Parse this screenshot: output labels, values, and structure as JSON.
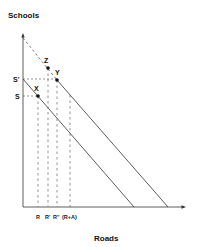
{
  "diagram": {
    "y_axis_label": "Schools",
    "x_axis_label": "Roads",
    "y_ticks": [
      {
        "label": "S'",
        "y": 79
      },
      {
        "label": "S",
        "y": 96
      }
    ],
    "x_ticks": [
      {
        "label": "R",
        "x": 38
      },
      {
        "label": "R'",
        "x": 48
      },
      {
        "label": "R''",
        "x": 57
      },
      {
        "label": "(R+A)",
        "x": 70
      }
    ],
    "points": [
      {
        "label": "Z",
        "x": 48,
        "y": 68
      },
      {
        "label": "Y",
        "x": 57,
        "y": 80
      },
      {
        "label": "X",
        "x": 38,
        "y": 96
      }
    ],
    "lines": [
      {
        "name": "inner-budget-line",
        "style": "solid",
        "from": [
          23,
          79
        ],
        "to": [
          134,
          207
        ]
      },
      {
        "name": "outer-budget-line",
        "style": "solid",
        "from": [
          57,
          80
        ],
        "to": [
          168,
          207
        ]
      },
      {
        "name": "outer-budget-line-extension",
        "style": "dashed",
        "from": [
          23,
          38
        ],
        "to": [
          57,
          80
        ]
      }
    ],
    "colors": {
      "line": "#333333",
      "text": "#111111"
    }
  }
}
